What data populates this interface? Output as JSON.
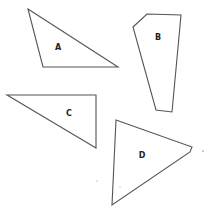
{
  "diagram": {
    "title": "",
    "background": "#ffffff",
    "stroke_color": "#555555",
    "shapes": [
      {
        "id": "A",
        "label": "A",
        "type": "triangle",
        "points": "28,9 43,67 118,67",
        "label_pos": [
          58,
          47
        ]
      },
      {
        "id": "B",
        "label": "B",
        "type": "pentagon",
        "points": "147,14 181,15 172,112 156,110 133,27",
        "label_pos": [
          158,
          37
        ]
      },
      {
        "id": "C",
        "label": "C",
        "type": "right-triangle",
        "points": "7,95 96,95 96,148",
        "label_pos": [
          69,
          113
        ]
      },
      {
        "id": "D",
        "label": "D",
        "type": "triangle",
        "points": "116,120 192,147 190,152 112,205",
        "label_pos": [
          142,
          155
        ]
      }
    ],
    "specks": [
      {
        "x": 203,
        "y": 151,
        "r": 0.8
      },
      {
        "x": 97,
        "y": 181,
        "r": 0.6
      },
      {
        "x": 120,
        "y": 187,
        "r": 0.5
      }
    ]
  }
}
